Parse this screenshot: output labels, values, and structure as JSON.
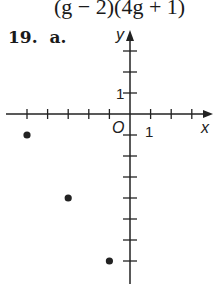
{
  "previous_answer": {
    "expression": "(g − 2)(4g + 1)"
  },
  "problem": {
    "number": "19.",
    "part": "a."
  },
  "chart_data": {
    "type": "scatter",
    "title": "",
    "xlabel": "x",
    "ylabel": "y",
    "origin_label": "O",
    "x_tick_label": "1",
    "y_tick_label": "1",
    "xlim": [
      -6,
      4
    ],
    "ylim": [
      -8,
      3
    ],
    "grid": false,
    "points": [
      {
        "x": -5,
        "y": -1
      },
      {
        "x": -3,
        "y": -4
      },
      {
        "x": -1,
        "y": -7
      }
    ]
  }
}
